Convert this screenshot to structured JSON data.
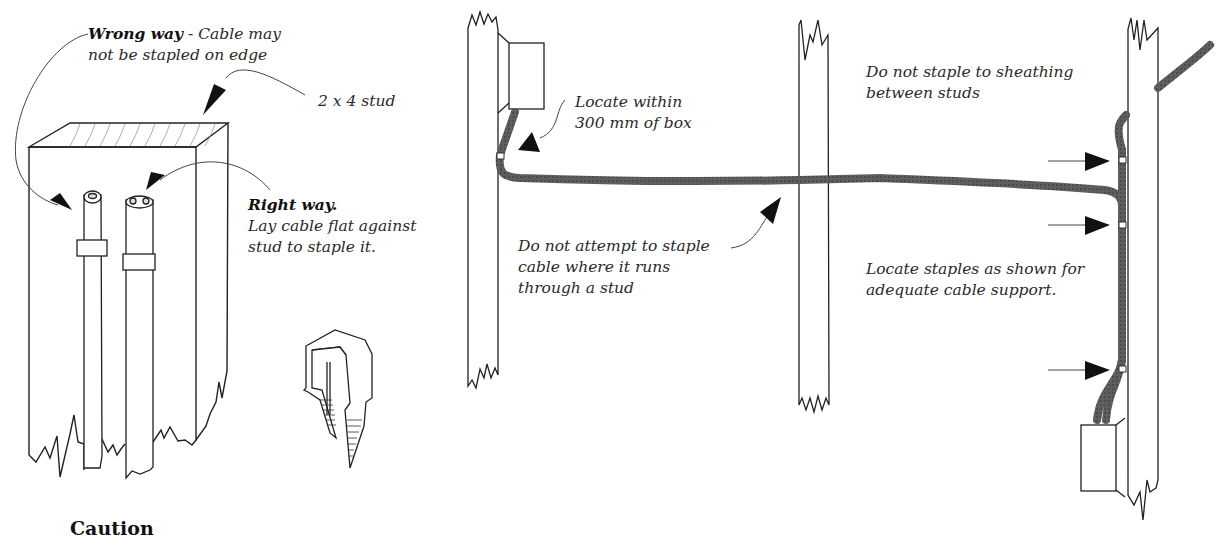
{
  "figure": {
    "left_panel": {
      "wrong_way": {
        "title": "Wrong way",
        "separator": " - ",
        "line1_rest": "Cable may",
        "line2": "not be stapled on edge"
      },
      "stud_label": "2  x  4 stud",
      "right_way": {
        "title": "Right way.",
        "line1": "Lay cable flat against",
        "line2": "stud to staple it."
      },
      "caution_heading": "Caution",
      "icons": [
        "cable-staple-icon"
      ]
    },
    "right_panel": {
      "locate_box": {
        "line1": "Locate within",
        "line2": "300 mm of box"
      },
      "no_staple_through_stud": {
        "line1": "Do not attempt to staple",
        "line2": "cable where it runs",
        "line3": "through a stud"
      },
      "no_sheathing": {
        "line1": "Do not staple to sheathing",
        "line2": "between studs"
      },
      "locate_staples": {
        "line1": "Locate staples as shown for",
        "line2": "adequate cable support."
      }
    },
    "colors": {
      "cable": "#5a5a5a",
      "line": "#222222",
      "arrow": "#111111",
      "background": "#ffffff"
    }
  }
}
